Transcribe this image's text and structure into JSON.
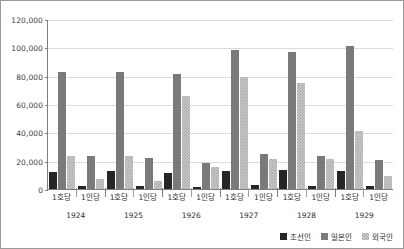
{
  "chart_data": {
    "type": "bar",
    "title": "",
    "xlabel": "",
    "ylabel": "",
    "ylim": [
      0,
      120000
    ],
    "ytick_step": 20000,
    "ytick_labels": [
      "120,000",
      "100,000",
      "80,000",
      "60,000",
      "40,000",
      "20,000",
      "0"
    ],
    "ytick_values": [
      120000,
      100000,
      80000,
      60000,
      40000,
      20000,
      0
    ],
    "grid": true,
    "legend_position": "bottom-right",
    "categories": [
      "1924",
      "1925",
      "1926",
      "1927",
      "1928",
      "1929"
    ],
    "subcategories": [
      "1호당",
      "1인당"
    ],
    "series": [
      {
        "name": "조선인",
        "color": "#262626",
        "values_per_household": [
          12000,
          12500,
          11500,
          13000,
          13500,
          12500
        ],
        "values_per_person": [
          1800,
          2200,
          1600,
          2600,
          2200,
          2000
        ]
      },
      {
        "name": "일본인",
        "color": "#7a7a7a",
        "values_per_household": [
          82500,
          82500,
          81000,
          98000,
          96500,
          101000
        ],
        "values_per_person": [
          23000,
          22000,
          18500,
          25000,
          23500,
          20500
        ]
      },
      {
        "name": "외국인",
        "color": "#c9c9c9",
        "values_per_household": [
          23500,
          23500,
          66000,
          79000,
          75000,
          41000
        ],
        "values_per_person": [
          7000,
          6000,
          15500,
          21500,
          21000,
          9000
        ]
      }
    ],
    "groups": [
      {
        "year": "1924",
        "bars": [
          {
            "sub": "1호당",
            "series": "조선인",
            "value": 12000
          },
          {
            "sub": "1호당",
            "series": "일본인",
            "value": 82500
          },
          {
            "sub": "1호당",
            "series": "외국인",
            "value": 23500
          },
          {
            "sub": "1인당",
            "series": "조선인",
            "value": 1800
          },
          {
            "sub": "1인당",
            "series": "일본인",
            "value": 23000
          },
          {
            "sub": "1인당",
            "series": "외국인",
            "value": 7000
          }
        ]
      },
      {
        "year": "1925",
        "bars": [
          {
            "sub": "1호당",
            "series": "조선인",
            "value": 12500
          },
          {
            "sub": "1호당",
            "series": "일본인",
            "value": 82500
          },
          {
            "sub": "1호당",
            "series": "외국인",
            "value": 23500
          },
          {
            "sub": "1인당",
            "series": "조선인",
            "value": 2200
          },
          {
            "sub": "1인당",
            "series": "일본인",
            "value": 22000
          },
          {
            "sub": "1인당",
            "series": "외국인",
            "value": 6000
          }
        ]
      },
      {
        "year": "1926",
        "bars": [
          {
            "sub": "1호당",
            "series": "조선인",
            "value": 11500
          },
          {
            "sub": "1호당",
            "series": "일본인",
            "value": 81000
          },
          {
            "sub": "1호당",
            "series": "외국인",
            "value": 66000
          },
          {
            "sub": "1인당",
            "series": "조선인",
            "value": 1600
          },
          {
            "sub": "1인당",
            "series": "일본인",
            "value": 18500
          },
          {
            "sub": "1인당",
            "series": "외국인",
            "value": 15500
          }
        ]
      },
      {
        "year": "1927",
        "bars": [
          {
            "sub": "1호당",
            "series": "조선인",
            "value": 13000
          },
          {
            "sub": "1호당",
            "series": "일본인",
            "value": 98000
          },
          {
            "sub": "1호당",
            "series": "외국인",
            "value": 79000
          },
          {
            "sub": "1인당",
            "series": "조선인",
            "value": 2600
          },
          {
            "sub": "1인당",
            "series": "일본인",
            "value": 25000
          },
          {
            "sub": "1인당",
            "series": "외국인",
            "value": 21500
          }
        ]
      },
      {
        "year": "1928",
        "bars": [
          {
            "sub": "1호당",
            "series": "조선인",
            "value": 13500
          },
          {
            "sub": "1호당",
            "series": "일본인",
            "value": 96500
          },
          {
            "sub": "1호당",
            "series": "외국인",
            "value": 75000
          },
          {
            "sub": "1인당",
            "series": "조선인",
            "value": 2200
          },
          {
            "sub": "1인당",
            "series": "일본인",
            "value": 23500
          },
          {
            "sub": "1인당",
            "series": "외국인",
            "value": 21000
          }
        ]
      },
      {
        "year": "1929",
        "bars": [
          {
            "sub": "1호당",
            "series": "조선인",
            "value": 12500
          },
          {
            "sub": "1호당",
            "series": "일본인",
            "value": 101000
          },
          {
            "sub": "1호당",
            "series": "외국인",
            "value": 41000
          },
          {
            "sub": "1인당",
            "series": "조선인",
            "value": 2000
          },
          {
            "sub": "1인당",
            "series": "일본인",
            "value": 20500
          },
          {
            "sub": "1인당",
            "series": "외국인",
            "value": 9000
          }
        ]
      }
    ],
    "legend": [
      {
        "label": "조선인",
        "color": "#262626",
        "pattern": "solid"
      },
      {
        "label": "일본인",
        "color": "#7a7a7a",
        "pattern": "solid"
      },
      {
        "label": "외국인",
        "color": "#c9c9c9",
        "pattern": "hatched"
      }
    ]
  }
}
